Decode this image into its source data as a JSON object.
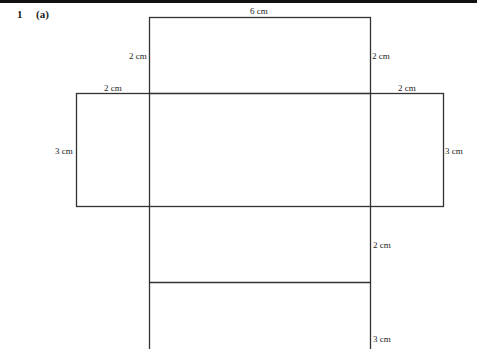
{
  "header": {
    "question_number": "1",
    "question_part": "(a)"
  },
  "net": {
    "line_color": "#333333",
    "labels": {
      "top_width": "6 cm",
      "top_left_height": "2 cm",
      "top_right_height": "2 cm",
      "left_flap_width": "2 cm",
      "right_flap_width": "2 cm",
      "left_flap_height": "3 cm",
      "right_flap_height": "3 cm",
      "lower_face_height": "2 cm",
      "bottom_face_height": "3 cm"
    }
  }
}
